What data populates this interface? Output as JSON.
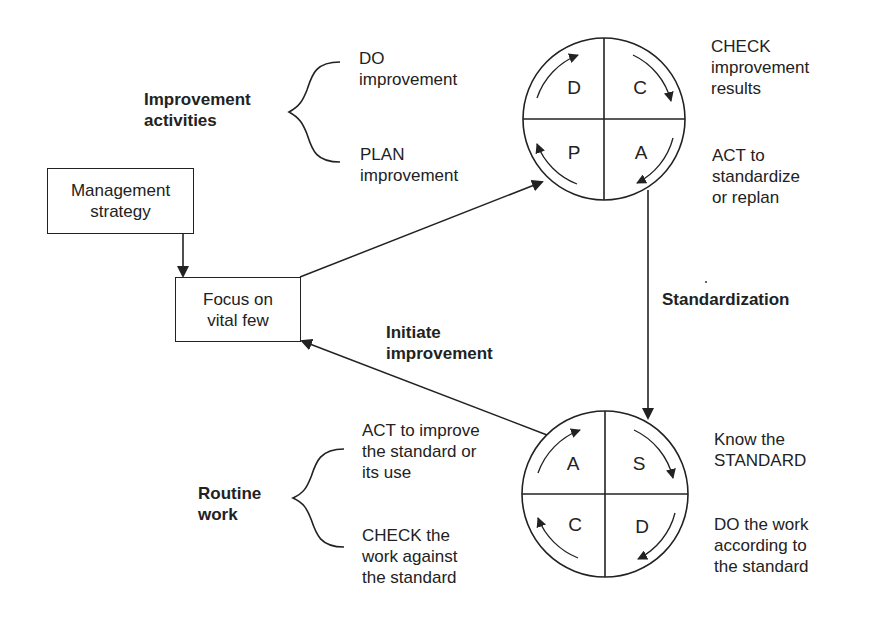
{
  "diagram": {
    "improvement_activities": {
      "group_label": [
        "Improvement",
        "activities"
      ],
      "do_label": [
        "DO",
        "improvement"
      ],
      "plan_label": [
        "PLAN",
        "improvement"
      ],
      "check_label": [
        "CHECK",
        "improvement",
        "results"
      ],
      "act_label": [
        "ACT to",
        "standardize",
        "or replan"
      ],
      "cycle": {
        "top_left": "D",
        "top_right": "C",
        "bottom_left": "P",
        "bottom_right": "A"
      }
    },
    "routine_work": {
      "group_label": [
        "Routine",
        "work"
      ],
      "act_label": [
        "ACT to improve",
        "the standard or",
        "its use"
      ],
      "check_label": [
        "CHECK the",
        "work against",
        "the standard"
      ],
      "standard_label": [
        "Know the",
        "STANDARD"
      ],
      "do_label": [
        "DO the work",
        "according to",
        "the standard"
      ],
      "cycle": {
        "top_left": "A",
        "top_right": "S",
        "bottom_left": "C",
        "bottom_right": "D"
      }
    },
    "boxes": {
      "management_strategy": [
        "Management",
        "strategy"
      ],
      "focus": [
        "Focus on",
        "vital few"
      ]
    },
    "arrows": {
      "standardization": "Standardization",
      "initiate_improvement": [
        "Initiate",
        "improvement"
      ]
    },
    "colors": {
      "stroke": "#222222",
      "background": "#ffffff"
    }
  }
}
